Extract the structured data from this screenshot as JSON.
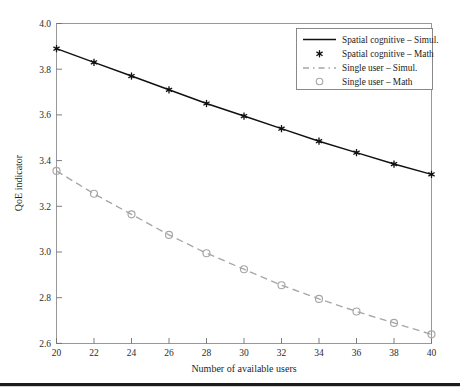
{
  "chart_data": {
    "type": "line",
    "title": "",
    "xlabel": "Number of available users",
    "ylabel": "QoE indicator",
    "x": [
      20,
      22,
      24,
      26,
      28,
      30,
      32,
      34,
      36,
      38,
      40
    ],
    "xlim": [
      20,
      40
    ],
    "ylim": [
      2.6,
      4.0
    ],
    "xticks": [
      20,
      22,
      24,
      26,
      28,
      30,
      32,
      34,
      36,
      38,
      40
    ],
    "yticks": [
      2.6,
      2.8,
      3.0,
      3.2,
      3.4,
      3.6,
      3.8,
      4.0
    ],
    "xtick_labels": [
      "20",
      "22",
      "24",
      "26",
      "28",
      "30",
      "32",
      "34",
      "36",
      "38",
      "40"
    ],
    "ytick_labels": [
      "2.6",
      "2.8",
      "3.0",
      "3.2",
      "3.4",
      "3.6",
      "3.8",
      "4.0"
    ],
    "grid": false,
    "legend_position": "top-right",
    "series": [
      {
        "name": "Spatial cognitive – Simul.",
        "style": "solid-line",
        "color": "#111111",
        "marker": "none",
        "values": [
          3.89,
          3.83,
          3.77,
          3.71,
          3.65,
          3.595,
          3.54,
          3.485,
          3.435,
          3.385,
          3.34
        ]
      },
      {
        "name": "Spatial cognitive – Math",
        "style": "markers",
        "color": "#111111",
        "marker": "star",
        "values": [
          3.89,
          3.83,
          3.77,
          3.71,
          3.65,
          3.595,
          3.54,
          3.485,
          3.435,
          3.385,
          3.34
        ]
      },
      {
        "name": "Single user – Simul.",
        "style": "dashed-line",
        "color": "#a6a6a6",
        "marker": "none",
        "values": [
          3.355,
          3.255,
          3.165,
          3.075,
          2.995,
          2.925,
          2.855,
          2.795,
          2.74,
          2.69,
          2.64
        ]
      },
      {
        "name": "Single user – Math",
        "style": "markers",
        "color": "#a6a6a6",
        "marker": "circle-open",
        "values": [
          3.355,
          3.255,
          3.165,
          3.075,
          2.995,
          2.925,
          2.855,
          2.795,
          2.74,
          2.69,
          2.64
        ]
      }
    ]
  },
  "axes": {
    "ylabel": "QoE indicator",
    "xlabel": "Number of available users",
    "ytick_labels": [
      "4.0",
      "3.8",
      "3.6",
      "3.4",
      "3.2",
      "3.0",
      "2.8",
      "2.6"
    ],
    "xtick_labels": [
      "20",
      "22",
      "24",
      "26",
      "28",
      "30",
      "32",
      "34",
      "36",
      "38",
      "40"
    ]
  },
  "legend": {
    "entries": [
      {
        "label": "Spatial cognitive – Simul.",
        "marker": "solid-line-swatch"
      },
      {
        "label": "Spatial cognitive – Math",
        "marker": "star-marker-swatch"
      },
      {
        "label": "Single user – Simul.",
        "marker": "dashed-line-swatch"
      },
      {
        "label": "Single user – Math",
        "marker": "circle-marker-swatch"
      }
    ]
  },
  "colors": {
    "series_primary": "#111111",
    "series_secondary": "#a6a6a6",
    "axis": "#8e8e8e",
    "text": "#1a1a1a",
    "bottom_rule": "#1c1c1c"
  }
}
